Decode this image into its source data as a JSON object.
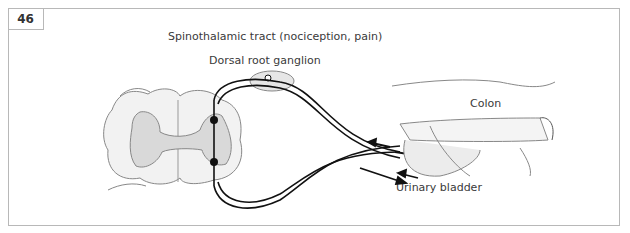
{
  "figure": {
    "number": "46",
    "labels": {
      "title": "Spinothalamic tract (nociception, pain)",
      "ganglion": "Dorsal root ganglion",
      "colon": "Colon",
      "bladder": "Urinary bladder"
    },
    "colors": {
      "border": "#b8b8b8",
      "grey_matter": "#d9d9d9",
      "white_matter": "#f2f2f2",
      "nerve": "#111111",
      "organ_line": "#888888"
    }
  }
}
